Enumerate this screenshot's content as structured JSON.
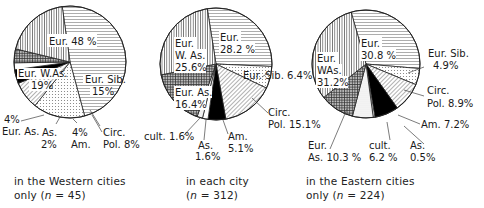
{
  "chart_data": [
    {
      "type": "pie",
      "id": "western",
      "caption_line1": "in the Western cities",
      "caption_line2": "only (n = 45)",
      "n": 45,
      "slices": [
        {
          "name": "Eur.",
          "value": 48,
          "label": "Eur. 48 %",
          "pattern": "hlines"
        },
        {
          "name": "Eur. Sib.",
          "value": 15,
          "label_lines": [
            "Eur. Sib.",
            "15%"
          ],
          "pattern": "dots"
        },
        {
          "name": "Circ. Pol.",
          "value": 8,
          "label_lines": [
            "Circ.",
            "Pol. 8%"
          ],
          "pattern": "diag"
        },
        {
          "name": "Am.",
          "value": 4,
          "label_lines": [
            "4%",
            "Am."
          ],
          "pattern": "black"
        },
        {
          "name": "As.",
          "value": 2,
          "label_lines": [
            "As.",
            "2%"
          ],
          "pattern": "white"
        },
        {
          "name": "Eur. As.",
          "value": 4,
          "label_lines": [
            "4%",
            "Eur. As."
          ],
          "pattern": "cross"
        },
        {
          "name": "Eur. W.As.",
          "value": 19,
          "label_lines": [
            "Eur. W.As.",
            "19%"
          ],
          "pattern": "vlines"
        }
      ]
    },
    {
      "type": "pie",
      "id": "each",
      "caption_line1": "in each city",
      "caption_line2": "(n = 312)",
      "n": 312,
      "slices": [
        {
          "name": "Eur.",
          "value": 28.2,
          "label_lines": [
            "Eur.",
            "28.2 %"
          ],
          "pattern": "hlines"
        },
        {
          "name": "Eur. Sib.",
          "value": 6.4,
          "label": "Eur. Sib. 6.4%",
          "pattern": "dots"
        },
        {
          "name": "Circ. Pol.",
          "value": 15.1,
          "label_lines": [
            "Circ.",
            "Pol. 15.1%"
          ],
          "pattern": "diag"
        },
        {
          "name": "Am.",
          "value": 5.1,
          "label_lines": [
            "Am.",
            "5.1%"
          ],
          "pattern": "black"
        },
        {
          "name": "As.",
          "value": 1.6,
          "label_lines": [
            "As.",
            "1.6%"
          ],
          "pattern": "white"
        },
        {
          "name": "cult.",
          "value": 1.6,
          "label": "cult. 1.6%",
          "pattern": "fine-dots"
        },
        {
          "name": "Eur. As.",
          "value": 16.4,
          "label_lines": [
            "Eur. As.",
            "16.4%"
          ],
          "pattern": "cross"
        },
        {
          "name": "Eur. W.As.",
          "value": 25.6,
          "label_lines": [
            "Eur.",
            "W. As.",
            "25.6%"
          ],
          "pattern": "vlines"
        }
      ]
    },
    {
      "type": "pie",
      "id": "eastern",
      "caption_line1": "in the Eastern cities",
      "caption_line2": "only (n = 224)",
      "n": 224,
      "slices": [
        {
          "name": "Eur.",
          "value": 30.8,
          "label_lines": [
            "Eur.",
            "30.8 %"
          ],
          "pattern": "hlines"
        },
        {
          "name": "Eur. Sib.",
          "value": 4.9,
          "label_lines": [
            "Eur. Sib.",
            "4.9%"
          ],
          "pattern": "dots"
        },
        {
          "name": "Circ. Pol.",
          "value": 8.9,
          "label_lines": [
            "Circ.",
            "Pol. 8.9%"
          ],
          "pattern": "diag"
        },
        {
          "name": "Am.",
          "value": 7.2,
          "label": "Am. 7.2%",
          "pattern": "black"
        },
        {
          "name": "As.",
          "value": 0.5,
          "label_lines": [
            "As.",
            "0.5%"
          ],
          "pattern": "white"
        },
        {
          "name": "cult.",
          "value": 6.2,
          "label_lines": [
            "cult.",
            "6.2 %"
          ],
          "pattern": "fine-dots"
        },
        {
          "name": "Eur. As.",
          "value": 10.3,
          "label_lines": [
            "Eur.",
            "As. 10.3 %"
          ],
          "pattern": "cross"
        },
        {
          "name": "Eur. W.As.",
          "value": 31.2,
          "label_lines": [
            "Eur.",
            "W.As.",
            "31.2%"
          ],
          "pattern": "vlines"
        }
      ]
    }
  ],
  "labels": {
    "w_eur": "Eur. 48 %",
    "w_sib1": "Eur. Sib.",
    "w_sib2": "15%",
    "w_wa1": "Eur. W.As.",
    "w_wa2": "19%",
    "w_ea1": "4%",
    "w_ea2": "Eur. As.",
    "w_as1": "As.",
    "w_as2": "2%",
    "w_am1": "4%",
    "w_am2": "Am.",
    "w_cp1": "Circ.",
    "w_cp2": "Pol. 8%",
    "m_eur1": "Eur.",
    "m_eur2": "28.2 %",
    "m_wa1": "Eur.",
    "m_wa2": "W. As.",
    "m_wa3": "25.6%",
    "m_sib": "Eur. Sib. 6.4%",
    "m_ea1": "Eur. As.",
    "m_ea2": "16.4%",
    "m_cp1": "Circ.",
    "m_cp2": "Pol. 15.1%",
    "m_cult": "cult. 1.6%",
    "m_as1": "As.",
    "m_as2": "1.6%",
    "m_am1": "Am.",
    "m_am2": "5.1%",
    "e_eur1": "Eur.",
    "e_eur2": "30.8 %",
    "e_wa1": "Eur.",
    "e_wa2": "WAs.",
    "e_wa3": "31.2%",
    "e_sib1": "Eur. Sib.",
    "e_sib2": "4.9%",
    "e_cp1": "Circ.",
    "e_cp2": "Pol. 8.9%",
    "e_am": "Am. 7.2%",
    "e_ea1": "Eur.",
    "e_ea2": "As. 10.3 %",
    "e_cult1": "cult.",
    "e_cult2": "6.2 %",
    "e_as1": "As.",
    "e_as2": "0.5%"
  },
  "captions": {
    "western_1": "in the Western cities",
    "western_2a": "only (",
    "western_2n": "n",
    "western_2b": " = 45)",
    "each_1": "in each city",
    "each_2a": "(",
    "each_2n": "n",
    "each_2b": " = 312)",
    "eastern_1": "in the Eastern cities",
    "eastern_2a": "only  (",
    "eastern_2n": "n",
    "eastern_2b": " = 224)"
  }
}
